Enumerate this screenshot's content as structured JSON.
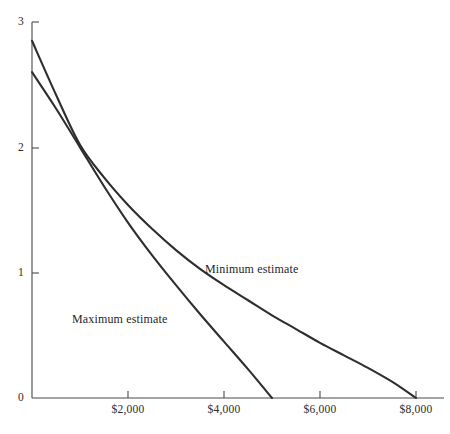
{
  "chart_data": {
    "type": "line",
    "title": "",
    "subtitle": "",
    "xlabel": "",
    "ylabel": "",
    "xlim": [
      0,
      8666
    ],
    "ylim": [
      0,
      3
    ],
    "grid": false,
    "legend_position": "inline-annotation",
    "x_ticks": [
      {
        "value": 2000,
        "label": "$2,000"
      },
      {
        "value": 4000,
        "label": "$4,000"
      },
      {
        "value": 6000,
        "label": "$6,000"
      },
      {
        "value": 8000,
        "label": "$8,000"
      }
    ],
    "y_ticks": [
      {
        "value": 0,
        "label": "0"
      },
      {
        "value": 1,
        "label": "1"
      },
      {
        "value": 2,
        "label": "2"
      },
      {
        "value": 3,
        "label": "3"
      }
    ],
    "series": [
      {
        "name": "Minimum estimate",
        "color": "#2e2e2e",
        "annotation": "Minimum estimate",
        "x": [
          0,
          500,
          1000,
          1500,
          2000,
          2500,
          3000,
          3500,
          4000,
          4500,
          5000,
          5500,
          6000,
          6500,
          7000,
          7500,
          8000
        ],
        "y": [
          2.85,
          2.42,
          2.02,
          1.76,
          1.54,
          1.35,
          1.18,
          1.03,
          0.9,
          0.78,
          0.66,
          0.55,
          0.44,
          0.34,
          0.24,
          0.13,
          0.0
        ]
      },
      {
        "name": "Maximum estimate",
        "color": "#2e2e2e",
        "annotation": "Maximum estimate",
        "x": [
          0,
          500,
          1000,
          1500,
          2000,
          2500,
          3000,
          3500,
          4000,
          4500,
          5000
        ],
        "y": [
          2.6,
          2.31,
          2.0,
          1.69,
          1.4,
          1.14,
          0.9,
          0.67,
          0.45,
          0.23,
          0.0
        ]
      }
    ],
    "annotations": [
      {
        "text": "Minimum estimate",
        "x_px": 205,
        "y_px": 262
      },
      {
        "text": "Maximum estimate",
        "x_px": 72,
        "y_px": 312
      }
    ]
  },
  "colors": {
    "background": "#ffffff",
    "axis": "#4a4a4a",
    "line": "#2e2e2e",
    "text": "#1f1f1f"
  }
}
